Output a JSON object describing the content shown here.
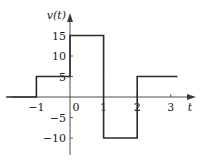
{
  "chart_data": {
    "type": "line",
    "style": "step",
    "title": "",
    "xlabel": "t",
    "ylabel": "v(t)",
    "xlim": [
      -1.9,
      3.2
    ],
    "ylim": [
      -13,
      18
    ],
    "grid": false,
    "legend": null,
    "x_ticks": [
      -1,
      0,
      1,
      2,
      3
    ],
    "x_tick_labels": [
      "−1",
      "0",
      "1",
      "2",
      "3"
    ],
    "y_ticks": [
      15,
      10,
      5,
      -5,
      -10
    ],
    "y_tick_labels": [
      "15",
      "10",
      "5",
      "−5",
      "−10"
    ],
    "series": [
      {
        "name": "v(t)",
        "segments": [
          {
            "t_start": -1.9,
            "t_end": -1,
            "value": 0
          },
          {
            "t_start": -1,
            "t_end": 0,
            "value": 5
          },
          {
            "t_start": 0,
            "t_end": 1,
            "value": 15
          },
          {
            "t_start": 1,
            "t_end": 2,
            "value": -10
          },
          {
            "t_start": 2,
            "t_end": 3.2,
            "value": 5
          }
        ],
        "x": [
          -1.9,
          -1,
          -1,
          0,
          0,
          1,
          1,
          2,
          2,
          3.2
        ],
        "y": [
          0,
          0,
          5,
          5,
          15,
          15,
          -10,
          -10,
          5,
          5
        ]
      }
    ]
  },
  "colors": {
    "line": "#2a2a2a",
    "axis": "#3a3a3a",
    "background": "#ffffff"
  }
}
